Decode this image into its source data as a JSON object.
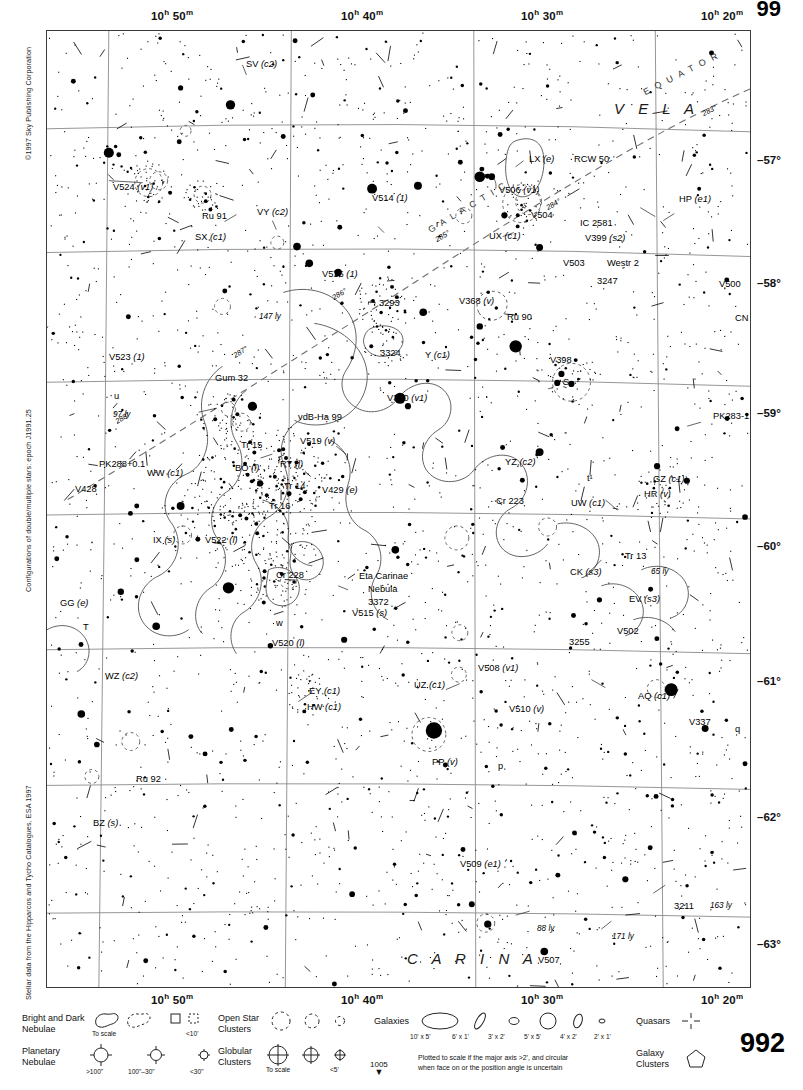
{
  "chart": {
    "page_number": "992",
    "page_number_top": "99",
    "next_chart": "1005",
    "copyright": "©1997 Sky Publishing Corporation",
    "note_doubles": "Configurations of double/multiple stars: epoch J1991.25",
    "note_source": "Stellar data from the Hipparcos and Tycho Catalogues, ESA 1997",
    "ra_labels": [
      {
        "h": "10",
        "m": "50",
        "x": 105
      },
      {
        "h": "10",
        "m": "40",
        "x": 295
      },
      {
        "h": "10",
        "m": "30",
        "x": 475
      },
      {
        "h": "10",
        "m": "20",
        "x": 655
      }
    ],
    "dec_labels": [
      {
        "label": "–57°",
        "y": 131
      },
      {
        "label": "–58°",
        "y": 254
      },
      {
        "label": "–59°",
        "y": 384
      },
      {
        "label": "–60°",
        "y": 517
      },
      {
        "label": "–61°",
        "y": 652
      },
      {
        "label": "–62°",
        "y": 788
      },
      {
        "label": "–63°",
        "y": 915
      }
    ],
    "constellations": [
      {
        "name": "V E L A",
        "x": 567,
        "y": 70
      },
      {
        "name": "C A R I N A",
        "x": 360,
        "y": 920
      }
    ],
    "galactic_equator": {
      "label_equator": "E Q U A T O R",
      "label_galactic": "G A L A C T I C",
      "ticks": [
        "283°",
        "284°",
        "285°",
        "286°",
        "287°",
        "288°"
      ]
    },
    "objects": [
      {
        "label": "SV (c2)",
        "x": 199,
        "y": 29,
        "italic_tail": true
      },
      {
        "label": "V524 (v1)",
        "x": 66,
        "y": 152
      },
      {
        "label": "Ru 91",
        "x": 155,
        "y": 181
      },
      {
        "label": "VY (c2)",
        "x": 210,
        "y": 177
      },
      {
        "label": "SX (c1)",
        "x": 148,
        "y": 202
      },
      {
        "label": "V514 (1)",
        "x": 325,
        "y": 163
      },
      {
        "label": "r",
        "x": 389,
        "y": 189
      },
      {
        "label": "V516 (1)",
        "x": 275,
        "y": 239
      },
      {
        "label": "147 ly",
        "x": 212,
        "y": 282
      },
      {
        "label": "3293",
        "x": 332,
        "y": 268
      },
      {
        "label": "V368 (v)",
        "x": 412,
        "y": 266
      },
      {
        "label": "Ru 90",
        "x": 460,
        "y": 282
      },
      {
        "label": "LX (e)",
        "x": 482,
        "y": 124
      },
      {
        "label": "RCW 50",
        "x": 527,
        "y": 124
      },
      {
        "label": "V506 (v1)",
        "x": 452,
        "y": 155
      },
      {
        "label": "V504",
        "x": 484,
        "y": 180
      },
      {
        "label": "IC 2581",
        "x": 533,
        "y": 188
      },
      {
        "label": "UX (c1)",
        "x": 442,
        "y": 201
      },
      {
        "label": "V399 (s2)",
        "x": 538,
        "y": 203
      },
      {
        "label": "V503",
        "x": 516,
        "y": 228
      },
      {
        "label": "Westr 2",
        "x": 560,
        "y": 228
      },
      {
        "label": "3247",
        "x": 550,
        "y": 246
      },
      {
        "label": "HP (e1)",
        "x": 632,
        "y": 164
      },
      {
        "label": "V499",
        "x": 722,
        "y": 175
      },
      {
        "label": "V500",
        "x": 672,
        "y": 249
      },
      {
        "label": "3199",
        "x": 704,
        "y": 255
      },
      {
        "label": "CN (c1)",
        "x": 688,
        "y": 283
      },
      {
        "label": "V523 (1)",
        "x": 62,
        "y": 322
      },
      {
        "label": "Gum 32",
        "x": 168,
        "y": 343
      },
      {
        "label": "u",
        "x": 67,
        "y": 361
      },
      {
        "label": "97 ly",
        "x": 66,
        "y": 380
      },
      {
        "label": "3324",
        "x": 333,
        "y": 318
      },
      {
        "label": "Y (c1)",
        "x": 378,
        "y": 320
      },
      {
        "label": "V370 (v1)",
        "x": 340,
        "y": 363
      },
      {
        "label": "V398",
        "x": 503,
        "y": 325
      },
      {
        "label": "S",
        "x": 516,
        "y": 347
      },
      {
        "label": "vdB-Ha 99",
        "x": 251,
        "y": 382
      },
      {
        "label": "PK283-1.1",
        "x": 666,
        "y": 381
      },
      {
        "label": "PK288+0.1",
        "x": 52,
        "y": 429
      },
      {
        "label": "WW (c1)",
        "x": 100,
        "y": 438
      },
      {
        "label": "V428",
        "x": 28,
        "y": 454
      },
      {
        "label": "Tr 15",
        "x": 194,
        "y": 410
      },
      {
        "label": "V519 (v)",
        "x": 253,
        "y": 406
      },
      {
        "label": "BO (l)",
        "x": 188,
        "y": 433
      },
      {
        "label": "RT (l)",
        "x": 233,
        "y": 429
      },
      {
        "label": "Tr 14",
        "x": 237,
        "y": 451
      },
      {
        "label": "V429 (e)",
        "x": 275,
        "y": 455
      },
      {
        "label": "t¹",
        "x": 540,
        "y": 443
      },
      {
        "label": "Tr 16",
        "x": 222,
        "y": 471
      },
      {
        "label": "YZ (c2)",
        "x": 458,
        "y": 427
      },
      {
        "label": "GZ (c1)",
        "x": 606,
        "y": 444
      },
      {
        "label": "HR (v)",
        "x": 597,
        "y": 459
      },
      {
        "label": "Cr 223",
        "x": 449,
        "y": 466
      },
      {
        "label": "UW (c1)",
        "x": 524,
        "y": 468
      },
      {
        "label": "IX (s)",
        "x": 106,
        "y": 505
      },
      {
        "label": "V522 (l)",
        "x": 158,
        "y": 505
      },
      {
        "label": "Tr 13",
        "x": 578,
        "y": 521
      },
      {
        "label": "65 ly",
        "x": 604,
        "y": 537
      },
      {
        "label": "CK (s3)",
        "x": 523,
        "y": 537
      },
      {
        "label": "EV (s3)",
        "x": 582,
        "y": 564
      },
      {
        "label": "GG (e)",
        "x": 13,
        "y": 568
      },
      {
        "label": "T",
        "x": 36,
        "y": 592
      },
      {
        "label": "Cr 228",
        "x": 229,
        "y": 540
      },
      {
        "label": "Eta Carinae",
        "x": 312,
        "y": 541
      },
      {
        "label": "Nebula",
        "x": 321,
        "y": 554
      },
      {
        "label": "3372",
        "x": 321,
        "y": 567
      },
      {
        "label": "V515 (s)",
        "x": 305,
        "y": 578
      },
      {
        "label": "w",
        "x": 229,
        "y": 588
      },
      {
        "label": "V520 (l)",
        "x": 225,
        "y": 608
      },
      {
        "label": "V502",
        "x": 570,
        "y": 596
      },
      {
        "label": "3255",
        "x": 522,
        "y": 607
      },
      {
        "label": "V508 (v1)",
        "x": 431,
        "y": 633
      },
      {
        "label": "WZ (c2)",
        "x": 58,
        "y": 641
      },
      {
        "label": "EY (c1)",
        "x": 262,
        "y": 656
      },
      {
        "label": "UZ (c1)",
        "x": 367,
        "y": 650
      },
      {
        "label": "HW (c1)",
        "x": 260,
        "y": 672
      },
      {
        "label": "V510 (v)",
        "x": 462,
        "y": 674
      },
      {
        "label": "AQ (c1)",
        "x": 591,
        "y": 661
      },
      {
        "label": "V337",
        "x": 642,
        "y": 687
      },
      {
        "label": "q",
        "x": 688,
        "y": 694
      },
      {
        "label": "PP (v)",
        "x": 385,
        "y": 727
      },
      {
        "label": "p",
        "x": 451,
        "y": 731
      },
      {
        "label": "V498",
        "x": 721,
        "y": 728
      },
      {
        "label": "Ru 92",
        "x": 89,
        "y": 744
      },
      {
        "label": "BZ (s)",
        "x": 46,
        "y": 788
      },
      {
        "label": "V509 (e1)",
        "x": 413,
        "y": 829
      },
      {
        "label": "3211",
        "x": 627,
        "y": 871
      },
      {
        "label": "163 ly",
        "x": 663,
        "y": 871
      },
      {
        "label": "88 ly",
        "x": 490,
        "y": 894
      },
      {
        "label": "171 ly",
        "x": 565,
        "y": 902
      },
      {
        "label": "V507",
        "x": 491,
        "y": 925
      },
      {
        "label": "EX (e1)",
        "x": 540,
        "y": 991
      }
    ]
  },
  "legend": {
    "bright_dark_nebulae": {
      "title_line1": "Bright and Dark",
      "title_line2": "Nebulae",
      "sub_to_scale": "To scale",
      "sub_small": "<10'"
    },
    "planetary_nebulae": {
      "title_line1": "Planetary",
      "title_line2": "Nebulae",
      "sub_large": ">100\"",
      "sub_mid": "100\"–30\"",
      "sub_small": "<30\""
    },
    "open_star_clusters": {
      "title_line1": "Open Star",
      "title_line2": "Clusters"
    },
    "globular_clusters": {
      "title_line1": "Globular",
      "title_line2": "Clusters",
      "sub_to_scale": "To scale",
      "sub_small": "<5'"
    },
    "galaxies": {
      "title": "Galaxies",
      "sizes": [
        "10' x 5'",
        "6' x 1'",
        "3' x 2'",
        "5' x 5'",
        "4' x 2'",
        "2' x 1'"
      ],
      "note_line1": "Plotted to scale if the major axis >2', and circular",
      "note_line2": "when face on or the position angle is uncertain"
    },
    "quasars": {
      "title": "Quasars"
    },
    "galaxy_clusters": {
      "title_line1": "Galaxy",
      "title_line2": "Clusters"
    }
  }
}
